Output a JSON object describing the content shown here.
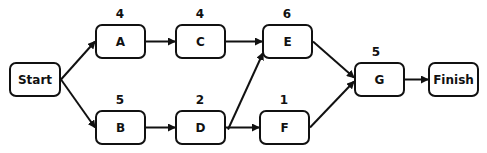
{
  "diagram": {
    "type": "activity-on-node network",
    "nodes": [
      {
        "id": "start",
        "label": "Start",
        "duration": null,
        "x": 9,
        "y": 62,
        "w": 52,
        "h": 35
      },
      {
        "id": "A",
        "label": "A",
        "duration": "4",
        "x": 95,
        "y": 24,
        "w": 51,
        "h": 35
      },
      {
        "id": "C",
        "label": "C",
        "duration": "4",
        "x": 175,
        "y": 24,
        "w": 51,
        "h": 35
      },
      {
        "id": "E",
        "label": "E",
        "duration": "6",
        "x": 262,
        "y": 24,
        "w": 51,
        "h": 35
      },
      {
        "id": "B",
        "label": "B",
        "duration": "5",
        "x": 95,
        "y": 110,
        "w": 51,
        "h": 35
      },
      {
        "id": "D",
        "label": "D",
        "duration": "2",
        "x": 175,
        "y": 110,
        "w": 51,
        "h": 35
      },
      {
        "id": "F",
        "label": "F",
        "duration": "1",
        "x": 259,
        "y": 110,
        "w": 51,
        "h": 35
      },
      {
        "id": "G",
        "label": "G",
        "duration": "5",
        "x": 354,
        "y": 62,
        "w": 51,
        "h": 35
      },
      {
        "id": "finish",
        "label": "Finish",
        "duration": null,
        "x": 428,
        "y": 62,
        "w": 51,
        "h": 35
      }
    ],
    "edges": [
      {
        "from": "start",
        "to": "A"
      },
      {
        "from": "start",
        "to": "B"
      },
      {
        "from": "A",
        "to": "C"
      },
      {
        "from": "B",
        "to": "D"
      },
      {
        "from": "C",
        "to": "E"
      },
      {
        "from": "D",
        "to": "E"
      },
      {
        "from": "D",
        "to": "F"
      },
      {
        "from": "E",
        "to": "G"
      },
      {
        "from": "F",
        "to": "G"
      },
      {
        "from": "G",
        "to": "finish"
      }
    ]
  }
}
